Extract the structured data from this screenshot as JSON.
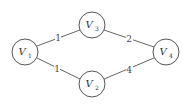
{
  "graph": {
    "nodes": [
      {
        "id": "V1",
        "letter": "V",
        "sub": "1",
        "x": 25,
        "y": 52
      },
      {
        "id": "V3",
        "letter": "V",
        "sub": "3",
        "x": 92,
        "y": 25
      },
      {
        "id": "V2",
        "letter": "V",
        "sub": "2",
        "x": 92,
        "y": 84
      },
      {
        "id": "V4",
        "letter": "V",
        "sub": "4",
        "x": 166,
        "y": 52
      }
    ],
    "edges": [
      {
        "from": "V1",
        "to": "V3",
        "weight": "1"
      },
      {
        "from": "V1",
        "to": "V2",
        "weight": "1"
      },
      {
        "from": "V3",
        "to": "V4",
        "weight": "2"
      },
      {
        "from": "V2",
        "to": "V4",
        "weight": "4"
      }
    ],
    "node_radius": 13
  }
}
